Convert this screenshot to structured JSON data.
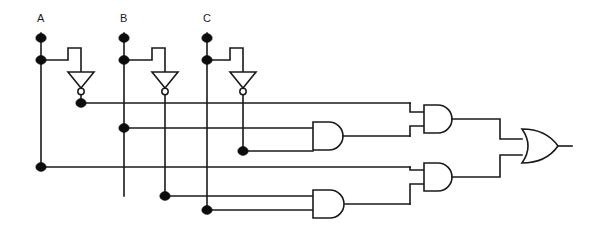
{
  "diagram": {
    "type": "logic-gate-schematic",
    "canvas": {
      "width": 595,
      "height": 227
    },
    "line_color": "#1a1a1a",
    "background_color": "#ffffff",
    "dot_color": "#0d0d0d"
  },
  "inputs": [
    {
      "id": "A",
      "label": "A",
      "label_x": 37,
      "label_y": 21,
      "rail_x": 41
    },
    {
      "id": "B",
      "label": "B",
      "label_x": 120,
      "label_y": 21,
      "rail_x": 124
    },
    {
      "id": "C",
      "label": "C",
      "label_x": 203,
      "label_y": 21,
      "rail_x": 207
    }
  ],
  "inverters": [
    {
      "id": "INV_A",
      "input": "A",
      "output": "A'",
      "out_x": 81
    },
    {
      "id": "INV_B",
      "input": "B",
      "output": "B'",
      "out_x": 165
    },
    {
      "id": "INV_C",
      "input": "C",
      "output": "C'",
      "out_x": 243
    }
  ],
  "gates": [
    {
      "id": "AND1",
      "type": "AND",
      "inputs": [
        "B",
        "C'"
      ],
      "x": 313,
      "y": 122
    },
    {
      "id": "AND2",
      "type": "AND",
      "inputs": [
        "A'",
        "AND1"
      ],
      "x": 424,
      "y": 105
    },
    {
      "id": "AND3",
      "type": "AND",
      "inputs": [
        "B'",
        "C"
      ],
      "x": 313,
      "y": 190
    },
    {
      "id": "AND4",
      "type": "AND",
      "inputs": [
        "A",
        "AND3"
      ],
      "x": 424,
      "y": 163
    },
    {
      "id": "OR1",
      "type": "OR",
      "inputs": [
        "AND2",
        "AND4"
      ],
      "x": 522,
      "y": 129
    }
  ],
  "buses": [
    {
      "id": "bus-a-not",
      "signal": "A'",
      "y": 103,
      "from_x": 81,
      "to_x": 410
    },
    {
      "id": "bus-b",
      "signal": "B",
      "y": 128,
      "from_x": 124,
      "to_x": 313
    },
    {
      "id": "bus-c-not",
      "signal": "C'",
      "y": 151,
      "from_x": 243,
      "to_x": 313
    },
    {
      "id": "bus-a",
      "signal": "A",
      "y": 167,
      "from_x": 41,
      "to_x": 410
    },
    {
      "id": "bus-b-not",
      "signal": "B'",
      "y": 196,
      "from_x": 165,
      "to_x": 313
    },
    {
      "id": "bus-c",
      "signal": "C",
      "y": 210,
      "from_x": 207,
      "to_x": 313
    }
  ],
  "junction_dots": [
    {
      "x": 41,
      "y": 38,
      "on": "A"
    },
    {
      "x": 41,
      "y": 60,
      "on": "A"
    },
    {
      "x": 41,
      "y": 167,
      "on": "A"
    },
    {
      "x": 124,
      "y": 38,
      "on": "B"
    },
    {
      "x": 124,
      "y": 60,
      "on": "B"
    },
    {
      "x": 124,
      "y": 128,
      "on": "B"
    },
    {
      "x": 207,
      "y": 38,
      "on": "C"
    },
    {
      "x": 207,
      "y": 60,
      "on": "C"
    },
    {
      "x": 207,
      "y": 210,
      "on": "C"
    },
    {
      "x": 81,
      "y": 103,
      "on": "A'"
    },
    {
      "x": 165,
      "y": 196,
      "on": "B'"
    },
    {
      "x": 243,
      "y": 151,
      "on": "C'"
    }
  ],
  "output": {
    "id": "OUT",
    "from": "OR1",
    "x": 570,
    "y": 146
  }
}
